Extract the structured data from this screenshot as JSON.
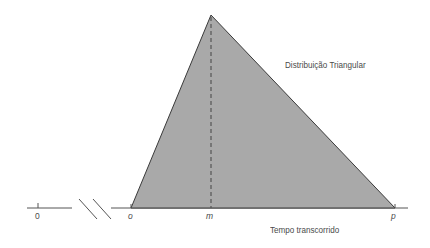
{
  "diagram": {
    "title": "Distribuição Triangular",
    "x_axis_label": "Tempo transcorrido",
    "ticks": {
      "zero": "0",
      "o": "o",
      "m": "m",
      "p": "p"
    },
    "colors": {
      "fill": "#a9a9a9",
      "stroke": "#3a3a3a",
      "axis": "#555555",
      "text": "#4a4a4a"
    }
  }
}
